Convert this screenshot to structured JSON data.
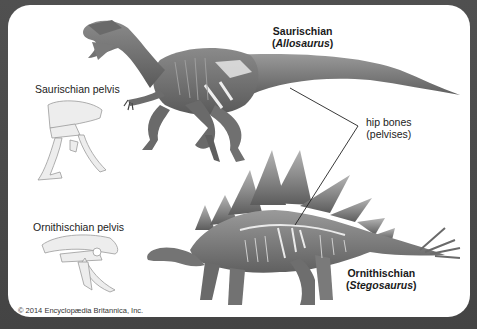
{
  "diagram": {
    "labels": {
      "saurischian_title": "Saurischian",
      "saurischian_genus": "Allosaurus",
      "ornithischian_title": "Ornithischian",
      "ornithischian_genus": "Stegosaurus",
      "saurischian_pelvis": "Saurischian pelvis",
      "ornithischian_pelvis": "Ornithischian pelvis",
      "hip_bones_line1": "hip bones",
      "hip_bones_line2": "(pelvises)"
    },
    "credit": "© 2014 Encyclopædia Britannica, Inc.",
    "colors": {
      "frame": "#4a4a4a",
      "panel": "#ffffff",
      "leader_line": "#222222",
      "bone": "#e8e8e8"
    }
  }
}
